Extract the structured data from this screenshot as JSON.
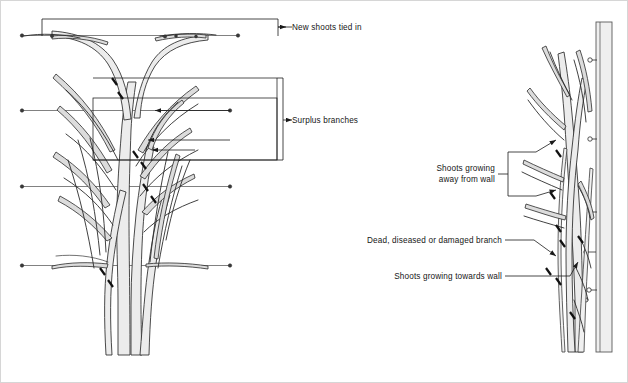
{
  "figure": {
    "panels": [
      {
        "id": "front-view",
        "name": "Front view of fan-trained tree on wires"
      },
      {
        "id": "side-view",
        "name": "Side view of plant against wall"
      }
    ]
  },
  "labels": {
    "new_shoots": "New shoots tied in",
    "surplus": "Surplus branches",
    "away_line1": "Shoots growing",
    "away_line2": "away from wall",
    "dead": "Dead, diseased or damaged branch",
    "towards": "Shoots growing towards wall"
  },
  "colors": {
    "stem_fill": "#ececec",
    "stem_stroke": "#2b2b2b",
    "wire": "#4a4a4a",
    "leader": "#1a1a1a",
    "wall_post": "#efefef",
    "frame": "#d6d6d6",
    "text": "#161616",
    "background": "#ffffff"
  },
  "elements": {
    "support_wires": 3,
    "wall_ties": 5,
    "cut_marks_front": 7,
    "cut_marks_side": 6,
    "arrow_leaders": 4
  }
}
